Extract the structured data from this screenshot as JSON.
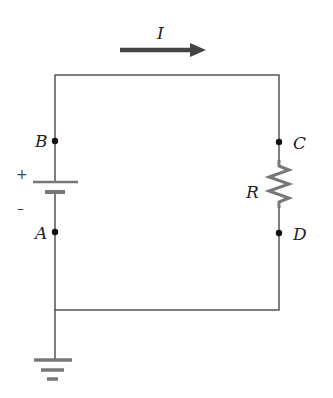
{
  "diagram": {
    "type": "circuit",
    "current": {
      "label": "I",
      "direction": "right"
    },
    "battery": {
      "positive_sign": "+",
      "negative_sign": "–"
    },
    "resistor": {
      "label": "R"
    },
    "nodes": {
      "A": "A",
      "B": "B",
      "C": "C",
      "D": "D"
    },
    "ground": true,
    "colors": {
      "wire": "#555555",
      "arrow": "#444444",
      "plate": "#777777",
      "text": "#222222"
    }
  }
}
